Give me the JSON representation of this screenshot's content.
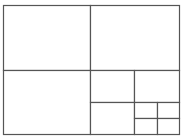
{
  "diagram": {
    "type": "recursive-rectangle-subdivision",
    "stroke_color": "#555555",
    "background": "#ffffff",
    "outer": {
      "x": 3,
      "y": 5,
      "w": 176,
      "h": 129
    },
    "cells": [
      {
        "id": "top-left",
        "x": 3,
        "y": 5,
        "w": 87,
        "h": 65
      },
      {
        "id": "top-right",
        "x": 90,
        "y": 5,
        "w": 89,
        "h": 65
      },
      {
        "id": "bottom-left",
        "x": 3,
        "y": 70,
        "w": 87,
        "h": 64
      },
      {
        "id": "br-top-left",
        "x": 90,
        "y": 70,
        "w": 44,
        "h": 32
      },
      {
        "id": "br-top-right",
        "x": 134,
        "y": 70,
        "w": 45,
        "h": 32
      },
      {
        "id": "br-bottom-left",
        "x": 90,
        "y": 102,
        "w": 44,
        "h": 32
      },
      {
        "id": "brr-top-left",
        "x": 134,
        "y": 102,
        "w": 23,
        "h": 16
      },
      {
        "id": "brr-top-right",
        "x": 157,
        "y": 102,
        "w": 22,
        "h": 16
      },
      {
        "id": "brr-bottom-left",
        "x": 134,
        "y": 118,
        "w": 23,
        "h": 16
      },
      {
        "id": "brr-bottom-right",
        "x": 157,
        "y": 118,
        "w": 22,
        "h": 16
      }
    ]
  }
}
